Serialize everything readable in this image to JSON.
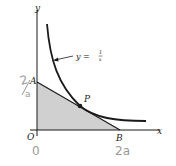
{
  "diagram": {
    "type": "geometry-figure",
    "axes": {
      "x_label": "x",
      "y_label": "y",
      "origin_label": "O"
    },
    "curve": {
      "equation_label": "y = ",
      "fraction_numerator": "1",
      "fraction_denominator": "x"
    },
    "points": {
      "A": "A",
      "B": "B",
      "P": "P"
    },
    "handwritten_annotations": {
      "near_A_top": "2",
      "near_A_bottom": "a",
      "below_O": "0",
      "below_B": "2a"
    },
    "colors": {
      "line": "#1a1a1a",
      "shading": "#d0d0d0",
      "handwriting": "#9a9a9a"
    }
  }
}
